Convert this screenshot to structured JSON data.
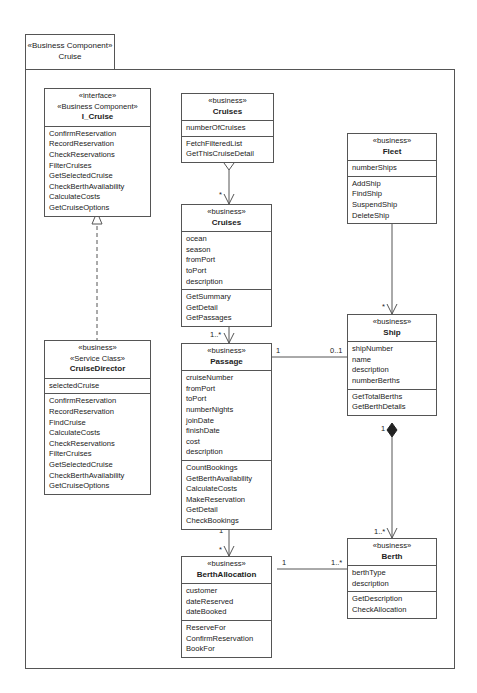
{
  "component": {
    "stereotype": "«Business Component»",
    "name": "Cruise"
  },
  "classes": {
    "i_cruise": {
      "stereotypes": [
        "«interface»",
        "«Business Component»"
      ],
      "name": "I_Cruise",
      "attributes": [],
      "operations": [
        "ConfirmReservation",
        "RecordReservation",
        "CheckReservations",
        "FilterCruises",
        "GetSelectedCruise",
        "CheckBerthAvailability",
        "CalculateCosts",
        "GetCruiseOptions"
      ]
    },
    "cruise_director": {
      "stereotypes": [
        "«business»",
        "«Service Class»"
      ],
      "name": "CruiseDirector",
      "attributes": [
        "selectedCruise"
      ],
      "operations": [
        "ConfirmReservation",
        "RecordReservation",
        "FindCruise",
        "CalculateCosts",
        "CheckReservations",
        "FilterCruises",
        "GetSelectedCruise",
        "CheckBerthAvailability",
        "GetCruiseOptions"
      ]
    },
    "cruises_collection": {
      "stereotypes": [
        "«business»"
      ],
      "name": "Cruises",
      "attributes": [
        "numberOfCruises"
      ],
      "operations": [
        "FetchFilteredList",
        "GetThisCruiseDetail"
      ]
    },
    "cruises": {
      "stereotypes": [
        "«business»"
      ],
      "name": "Cruises",
      "attributes": [
        "ocean",
        "season",
        "fromPort",
        "toPort",
        "description"
      ],
      "operations": [
        "GetSummary",
        "GetDetail",
        "GetPassages"
      ]
    },
    "passage": {
      "stereotypes": [
        "«business»"
      ],
      "name": "Passage",
      "attributes": [
        "cruiseNumber",
        "fromPort",
        "toPort",
        "numberNights",
        "joinDate",
        "finishDate",
        "cost",
        "description"
      ],
      "operations": [
        "CountBookings",
        "GetBerthAvailability",
        "CalculateCosts",
        "MakeReservation",
        "GetDetail",
        "CheckBookings"
      ]
    },
    "berth_allocation": {
      "stereotypes": [
        "«business»"
      ],
      "name": "BerthAllocation",
      "attributes": [
        "customer",
        "dateReserved",
        "dateBooked"
      ],
      "operations": [
        "ReserveFor",
        "ConfirmReservation",
        "BookFor"
      ]
    },
    "fleet": {
      "stereotypes": [
        "«business»"
      ],
      "name": "Fleet",
      "attributes": [
        "numberShips"
      ],
      "operations": [
        "AddShip",
        "FindShip",
        "SuspendShip",
        "DeleteShip"
      ]
    },
    "ship": {
      "stereotypes": [
        "«business»"
      ],
      "name": "Ship",
      "attributes": [
        "shipNumber",
        "name",
        "description",
        "numberBerths"
      ],
      "operations": [
        "GetTotalBerths",
        "GetBerthDetails"
      ]
    },
    "berth": {
      "stereotypes": [
        "«business»"
      ],
      "name": "Berth",
      "attributes": [
        "berthType",
        "description"
      ],
      "operations": [
        "GetDescription",
        "CheckAllocation"
      ]
    }
  },
  "relationships": [
    {
      "type": "realization",
      "from": "CruiseDirector",
      "to": "I_Cruise"
    },
    {
      "type": "aggregation",
      "whole": "Cruises (collection)",
      "part": "Cruises",
      "whole_mult": "1",
      "part_mult": "*"
    },
    {
      "type": "composition",
      "whole": "Cruises",
      "part": "Passage",
      "whole_mult": "1",
      "part_mult": "1..*"
    },
    {
      "type": "association",
      "from": "Passage",
      "to": "BerthAllocation",
      "from_mult": "1",
      "to_mult": "*"
    },
    {
      "type": "association",
      "from": "Passage",
      "to": "Ship",
      "from_mult": "1",
      "to_mult": "0..1"
    },
    {
      "type": "aggregation",
      "whole": "Fleet",
      "part": "Ship",
      "whole_mult": "1",
      "part_mult": "*"
    },
    {
      "type": "composition",
      "whole": "Ship",
      "part": "Berth",
      "whole_mult": "1",
      "part_mult": "1..*"
    },
    {
      "type": "association",
      "from": "BerthAllocation",
      "to": "Berth",
      "from_mult": "1",
      "to_mult": "1..*"
    }
  ],
  "multiplicities": {
    "agg_cruises_whole": "1",
    "agg_cruises_part": "*",
    "comp_cruises_whole": "1",
    "comp_cruises_part": "1..*",
    "passage_ba_from": "1",
    "passage_ba_to": "*",
    "passage_ship_from": "1",
    "passage_ship_to": "0..1",
    "fleet_whole": "1",
    "fleet_part": "*",
    "ship_whole": "1",
    "ship_part": "1..*",
    "ba_berth_from": "1",
    "ba_berth_to": "1..*"
  }
}
